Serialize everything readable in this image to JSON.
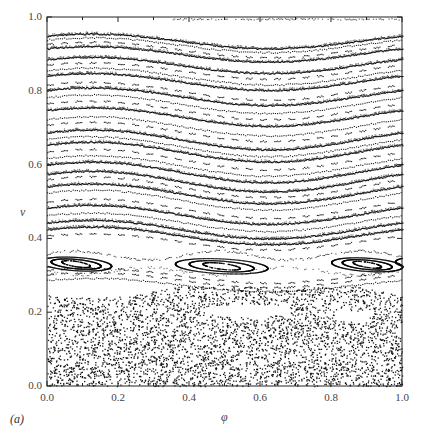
{
  "figure": {
    "panel_label": "(a)",
    "xlabel": "φ",
    "ylabel": "v",
    "xticks": [
      "0.0",
      "0.2",
      "0.4",
      "0.6",
      "0.8",
      "1.0"
    ],
    "yticks": [
      "0.0",
      "0.2",
      "0.4",
      "0.6",
      "0.8",
      "1.0"
    ]
  },
  "chart_data": {
    "type": "scatter",
    "title": "",
    "subtitle": "Poincaré section (phase-space surface of section)",
    "xlabel": "φ",
    "ylabel": "v",
    "xlim": [
      0.0,
      1.0
    ],
    "ylim": [
      0.0,
      1.0
    ],
    "xticks": [
      0.0,
      0.2,
      0.4,
      0.6,
      0.8,
      1.0
    ],
    "yticks": [
      0.0,
      0.2,
      0.4,
      0.6,
      0.8,
      1.0
    ],
    "grid": false,
    "legend": null,
    "annotations": [
      "(a)"
    ],
    "marker_color": "#000000",
    "regions": [
      {
        "name": "KAM invariant curves",
        "v_range": [
          0.4,
          0.95
        ],
        "shape": "sinusoidal wavy lines, max near φ≈0.2, min near φ≈0.65, amplitude ≈0.02-0.03"
      },
      {
        "name": "resonance island chain",
        "v_range": [
          0.3,
          0.36
        ],
        "island_centers_phi": [
          0.08,
          0.48,
          0.88
        ],
        "v_center": 0.335
      },
      {
        "name": "chaotic sea",
        "v_range": [
          0.0,
          0.28
        ],
        "shape": "scattered dots",
        "gap": {
          "phi": 0.55,
          "v": 0.2
        }
      },
      {
        "name": "top boundary orbit",
        "v": 0.995
      }
    ],
    "invariant_curves": [
      {
        "v0": 0.935,
        "amp": 0.02,
        "style": "dense"
      },
      {
        "v0": 0.925,
        "amp": 0.02,
        "style": "dotted"
      },
      {
        "v0": 0.912,
        "amp": 0.021,
        "style": "dashed"
      },
      {
        "v0": 0.9,
        "amp": 0.021,
        "style": "dense"
      },
      {
        "v0": 0.87,
        "amp": 0.022,
        "style": "dense"
      },
      {
        "v0": 0.855,
        "amp": 0.022,
        "style": "dashed"
      },
      {
        "v0": 0.84,
        "amp": 0.023,
        "style": "dotted"
      },
      {
        "v0": 0.825,
        "amp": 0.023,
        "style": "dense"
      },
      {
        "v0": 0.8,
        "amp": 0.024,
        "style": "dashed"
      },
      {
        "v0": 0.785,
        "amp": 0.024,
        "style": "dense"
      },
      {
        "v0": 0.765,
        "amp": 0.025,
        "style": "dotted"
      },
      {
        "v0": 0.748,
        "amp": 0.025,
        "style": "dashed"
      },
      {
        "v0": 0.73,
        "amp": 0.025,
        "style": "dense"
      },
      {
        "v0": 0.705,
        "amp": 0.026,
        "style": "dotted"
      },
      {
        "v0": 0.69,
        "amp": 0.026,
        "style": "dashed"
      },
      {
        "v0": 0.668,
        "amp": 0.027,
        "style": "dense"
      },
      {
        "v0": 0.65,
        "amp": 0.027,
        "style": "dotted"
      },
      {
        "v0": 0.635,
        "amp": 0.027,
        "style": "dense"
      },
      {
        "v0": 0.615,
        "amp": 0.028,
        "style": "dashed"
      },
      {
        "v0": 0.598,
        "amp": 0.028,
        "style": "dotted"
      },
      {
        "v0": 0.58,
        "amp": 0.028,
        "style": "dense"
      },
      {
        "v0": 0.555,
        "amp": 0.028,
        "style": "dense"
      },
      {
        "v0": 0.54,
        "amp": 0.028,
        "style": "dashed"
      },
      {
        "v0": 0.522,
        "amp": 0.027,
        "style": "dense"
      },
      {
        "v0": 0.505,
        "amp": 0.027,
        "style": "dotted"
      },
      {
        "v0": 0.482,
        "amp": 0.026,
        "style": "dashed"
      },
      {
        "v0": 0.465,
        "amp": 0.026,
        "style": "dense"
      },
      {
        "v0": 0.445,
        "amp": 0.025,
        "style": "dotted"
      },
      {
        "v0": 0.425,
        "amp": 0.025,
        "style": "dense"
      },
      {
        "v0": 0.408,
        "amp": 0.024,
        "style": "dense"
      },
      {
        "v0": 0.392,
        "amp": 0.022,
        "style": "dashed"
      },
      {
        "v0": 0.3,
        "amp": 0.02,
        "style": "dashed"
      },
      {
        "v0": 0.288,
        "amp": 0.02,
        "style": "dashed"
      },
      {
        "v0": 0.275,
        "amp": 0.018,
        "style": "dotted"
      }
    ],
    "islands": [
      {
        "phi_c": 0.08,
        "v_c": 0.332,
        "half_width": 0.1,
        "half_height": 0.018
      },
      {
        "phi_c": 0.49,
        "v_c": 0.326,
        "half_width": 0.13,
        "half_height": 0.02
      },
      {
        "phi_c": 0.9,
        "v_c": 0.33,
        "half_width": 0.1,
        "half_height": 0.018
      }
    ],
    "chaos": {
      "v_max": 0.27,
      "n_points": 4200,
      "seed": 7
    }
  }
}
